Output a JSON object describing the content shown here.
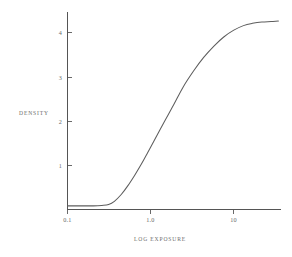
{
  "figure": {
    "background_color": "#ffffff",
    "line_color": "#5d5d5d",
    "axis_color": "#555555",
    "text_color": "#6a6a6a"
  },
  "labels": {
    "y_axis_title": "DENSITY",
    "x_axis_title": "LOG EXPOSURE"
  },
  "chart_data": {
    "type": "line",
    "title": "",
    "xlabel": "LOG EXPOSURE",
    "ylabel": "DENSITY",
    "x_scale": "log",
    "xlim": [
      0.1,
      30
    ],
    "ylim": [
      0,
      4.35
    ],
    "grid": false,
    "legend": null,
    "x_tick_labels": [
      "0.1",
      "1.0",
      "10"
    ],
    "x_tick_values": [
      0.1,
      1.0,
      10
    ],
    "y_tick_labels": [
      "1",
      "2",
      "3",
      "4"
    ],
    "y_tick_values": [
      1,
      2,
      3,
      4
    ],
    "series": [
      {
        "name": "characteristic curve",
        "x": [
          0.1,
          0.15,
          0.2,
          0.25,
          0.3,
          0.35,
          0.42,
          0.5,
          0.6,
          0.72,
          0.85,
          1.0,
          1.3,
          1.7,
          2.2,
          2.9,
          3.8,
          5.0,
          6.5,
          8.5,
          11.0,
          14.0,
          18.0,
          23.0,
          28.0
        ],
        "y": [
          0.08,
          0.08,
          0.08,
          0.09,
          0.11,
          0.18,
          0.33,
          0.52,
          0.75,
          1.0,
          1.25,
          1.5,
          1.9,
          2.3,
          2.7,
          3.05,
          3.35,
          3.6,
          3.8,
          3.95,
          4.05,
          4.1,
          4.13,
          4.14,
          4.15
        ]
      }
    ],
    "annotations": []
  }
}
